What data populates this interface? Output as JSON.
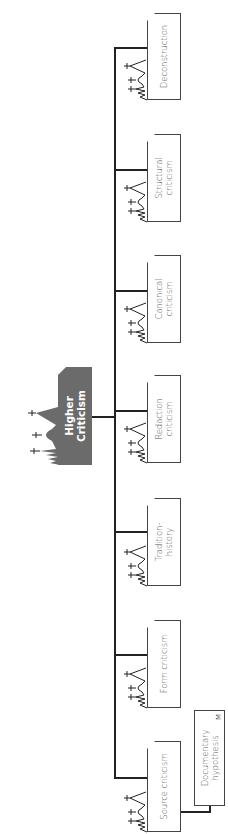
{
  "diagram": {
    "title": "Higher Criticism",
    "root": {
      "label": "Higher\nCriticism",
      "fill": "#6b6b6b",
      "text_color": "#ffffff"
    },
    "children": [
      {
        "id": "source",
        "label": "Source criticism"
      },
      {
        "id": "form",
        "label": "Form criticism"
      },
      {
        "id": "tradition",
        "label": "Tradition-\nhistory"
      },
      {
        "id": "redaction",
        "label": "Redaction\ncriticism"
      },
      {
        "id": "canonical",
        "label": "Canonical\ncriticism"
      },
      {
        "id": "structural",
        "label": "Structural\ncriticism"
      },
      {
        "id": "deconstruction",
        "label": "Deconstruction"
      }
    ],
    "sub_nodes": [
      {
        "parent": "source",
        "label": "Documentary\nhypothesis",
        "marker": "M"
      }
    ],
    "colors": {
      "line": "#222222",
      "node_border": "#444444",
      "node_text": "#555555"
    }
  }
}
